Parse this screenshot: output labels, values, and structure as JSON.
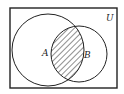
{
  "diagram": {
    "type": "venn",
    "universe_label": "U",
    "sets": [
      {
        "label": "A"
      },
      {
        "label": "B"
      }
    ],
    "shaded_region": "A ∩ B",
    "colors": {
      "stroke": "#222222",
      "background": "#ffffff"
    }
  }
}
